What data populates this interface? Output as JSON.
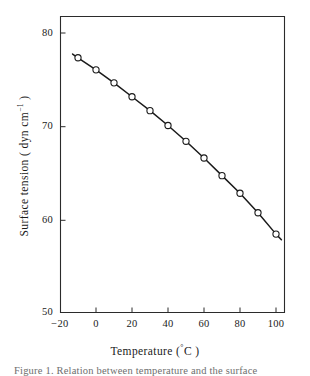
{
  "chart_data": {
    "type": "line",
    "title": "",
    "subtitle": "",
    "xlabel": "Temperature (°C)",
    "ylabel": "Surface tension (dyn cm⁻¹)",
    "xlim": [
      -20,
      105
    ],
    "ylim": [
      50,
      82
    ],
    "grid": false,
    "legend": null,
    "legend_position": "none",
    "marker": "open-circle",
    "line_style": "solid",
    "line_color": "#1a1a1a",
    "marker_face_color": "#ffffff",
    "x_ticks": [
      -20,
      0,
      20,
      40,
      60,
      80,
      100
    ],
    "x_tick_labels": [
      "−20",
      "0",
      "20",
      "40",
      "60",
      "80",
      "100"
    ],
    "y_ticks": [
      50,
      60,
      70,
      80
    ],
    "y_tick_labels": [
      "50",
      "60",
      "70",
      "80"
    ],
    "x": [
      -10,
      0,
      10,
      20,
      30,
      40,
      50,
      60,
      70,
      80,
      90,
      100
    ],
    "values": [
      77.5,
      76.2,
      74.8,
      73.3,
      71.8,
      70.2,
      68.5,
      66.7,
      64.8,
      62.9,
      60.8,
      58.5
    ],
    "series": [
      {
        "name": "Surface tension",
        "x": [
          -10,
          0,
          10,
          20,
          30,
          40,
          50,
          60,
          70,
          80,
          90,
          100
        ],
        "values": [
          77.5,
          76.2,
          74.8,
          73.3,
          71.8,
          70.2,
          68.5,
          66.7,
          64.8,
          62.9,
          60.8,
          58.5
        ]
      }
    ],
    "line_extension": {
      "left_x": -13,
      "left_y": 77.9,
      "right_x": 103,
      "right_y": 57.9
    },
    "annotations": []
  },
  "axes": {
    "y_title_main": "Surface tension ( dyn  cm",
    "y_title_sup": "−1",
    "y_title_close": " )",
    "x_title_main": "Temperature (",
    "x_title_deg": "°",
    "x_title_unit": "C )"
  },
  "caption": {
    "text": "Figure 1.  Relation between temperature and the surface"
  },
  "colors": {
    "background": "#ffffff",
    "axis": "#2b2b2b",
    "line": "#1a1a1a",
    "text": "#1a1a1a",
    "caption": "#6e6e6e"
  }
}
